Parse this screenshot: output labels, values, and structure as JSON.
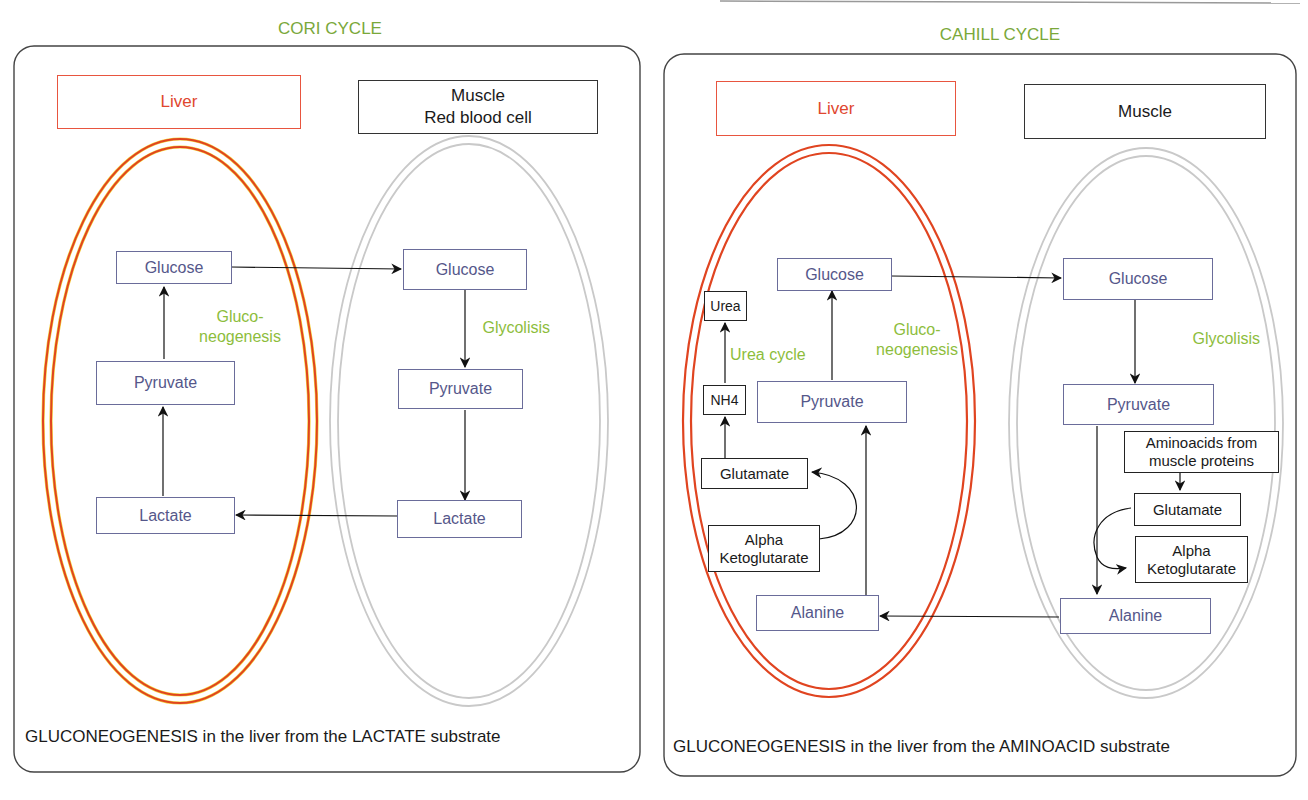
{
  "colors": {
    "title_green": "#7aa83a",
    "process_green": "#8dbd3c",
    "liver_red": "#e0472e",
    "muscle_gray": "#c8c8c8",
    "metabolite_blue": "#55578a"
  },
  "cori": {
    "title": "CORI CYCLE",
    "liver_label": "Liver",
    "muscle_label_line1": "Muscle",
    "muscle_label_line2": "Red blood cell",
    "liver": {
      "glucose": "Glucose",
      "pyruvate": "Pyruvate",
      "lactate": "Lactate",
      "process_line1": "Gluco-",
      "process_line2": "neogenesis"
    },
    "muscle": {
      "glucose": "Glucose",
      "pyruvate": "Pyruvate",
      "lactate": "Lactate",
      "process": "Glycolisis"
    },
    "caption": {
      "part1": "GLUCONEOGENESIS",
      "part2": " in the liver from the ",
      "part3": "LACTATE",
      "part4": " substrate"
    }
  },
  "cahill": {
    "title": "CAHILL CYCLE",
    "liver_label": "Liver",
    "muscle_label": "Muscle",
    "liver": {
      "glucose": "Glucose",
      "pyruvate": "Pyruvate",
      "alanine": "Alanine",
      "urea": "Urea",
      "nh4": "NH4",
      "glutamate": "Glutamate",
      "akg_line1": "Alpha",
      "akg_line2": "Ketoglutarate",
      "urea_cycle": "Urea cycle",
      "process_line1": "Gluco-",
      "process_line2": "neogenesis"
    },
    "muscle": {
      "glucose": "Glucose",
      "pyruvate": "Pyruvate",
      "alanine": "Alanine",
      "aminoacids_line1": "Aminoacids from",
      "aminoacids_line2": "muscle proteins",
      "glutamate": "Glutamate",
      "akg_line1": "Alpha",
      "akg_line2": "Ketoglutarate",
      "process": "Glycolisis"
    },
    "caption": {
      "part1": "GLUCONEOGENESIS",
      "part2": " in the liver from the ",
      "part3": "AMINOACID",
      "part4": " substrate"
    }
  }
}
